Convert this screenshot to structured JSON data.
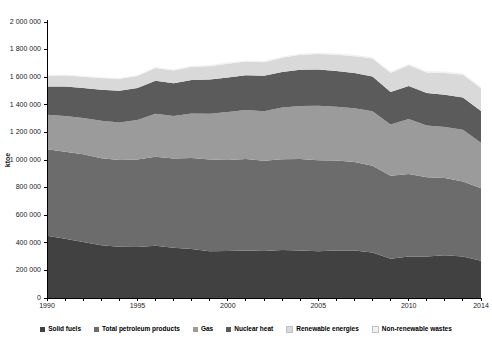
{
  "chart_data": {
    "type": "area",
    "stacked": true,
    "title": "",
    "subtitle": "",
    "xlabel": "",
    "ylabel": "ktoe",
    "ylim": [
      0,
      2000000
    ],
    "xlim": [
      1990,
      2014
    ],
    "grid": false,
    "legend_position": "bottom",
    "ytick_labels": [
      "0",
      "200 000",
      "400 000",
      "600 000",
      "800 000",
      "1 000 000",
      "1 200 000",
      "1 400 000",
      "1 600 000",
      "1 800 000",
      "2 000 000"
    ],
    "ytick_values": [
      0,
      200000,
      400000,
      600000,
      800000,
      1000000,
      1200000,
      1400000,
      1600000,
      1800000,
      2000000
    ],
    "xtick_labels": [
      "1990",
      "1995",
      "2000",
      "2005",
      "2010",
      "2014"
    ],
    "xtick_values": [
      1990,
      1995,
      2000,
      2005,
      2010,
      2014
    ],
    "x": [
      1990,
      1991,
      1992,
      1993,
      1994,
      1995,
      1996,
      1997,
      1998,
      1999,
      2000,
      2001,
      2002,
      2003,
      2004,
      2005,
      2006,
      2007,
      2008,
      2009,
      2010,
      2011,
      2012,
      2013,
      2014
    ],
    "series": [
      {
        "name": "Solid fuels",
        "color": "#414141",
        "values": [
          451000,
          430000,
          405000,
          382000,
          372000,
          370000,
          378000,
          365000,
          355000,
          338000,
          340000,
          345000,
          340000,
          348000,
          345000,
          339000,
          345000,
          345000,
          330000,
          285000,
          300000,
          300000,
          310000,
          300000,
          270000
        ]
      },
      {
        "name": "Total petroleum products",
        "color": "#6c6c6c",
        "values": [
          627000,
          630000,
          637000,
          630000,
          628000,
          634000,
          645000,
          645000,
          660000,
          665000,
          660000,
          662000,
          655000,
          657000,
          662000,
          660000,
          652000,
          640000,
          628000,
          600000,
          598000,
          575000,
          560000,
          545000,
          525000
        ]
      },
      {
        "name": "Gas",
        "color": "#9b9b9b",
        "values": [
          250000,
          258000,
          262000,
          272000,
          272000,
          285000,
          312000,
          308000,
          322000,
          333000,
          348000,
          355000,
          358000,
          375000,
          385000,
          395000,
          388000,
          390000,
          395000,
          372000,
          400000,
          375000,
          370000,
          375000,
          330000
        ]
      },
      {
        "name": "Nuclear heat",
        "color": "#5b5b5b",
        "values": [
          205000,
          215000,
          218000,
          225000,
          230000,
          232000,
          240000,
          238000,
          243000,
          248000,
          250000,
          253000,
          257000,
          258000,
          262000,
          262000,
          260000,
          255000,
          252000,
          236000,
          238000,
          236000,
          232000,
          232000,
          230000
        ]
      },
      {
        "name": "Renewable energies",
        "color": "#d9d9d9",
        "values": [
          78000,
          80000,
          82000,
          85000,
          86000,
          88000,
          92000,
          92000,
          95000,
          96000,
          100000,
          98000,
          98000,
          103000,
          108000,
          112000,
          118000,
          122000,
          130000,
          138000,
          150000,
          148000,
          158000,
          165000,
          165000
        ]
      },
      {
        "name": "Non-renewable wastes",
        "color": "#f1f1f1",
        "values": [
          6000,
          6000,
          6500,
          6500,
          7000,
          7000,
          7500,
          7500,
          8000,
          8000,
          8500,
          8500,
          9000,
          9000,
          9500,
          9500,
          10000,
          10000,
          10000,
          10000,
          10500,
          10500,
          10500,
          11000,
          11000
        ]
      }
    ]
  },
  "legend": {
    "items": [
      {
        "label": "Solid fuels",
        "color": "#414141"
      },
      {
        "label": "Total petroleum products",
        "color": "#6c6c6c"
      },
      {
        "label": "Gas",
        "color": "#9b9b9b"
      },
      {
        "label": "Nuclear heat",
        "color": "#5b5b5b"
      },
      {
        "label": "Renewable energies",
        "color": "#d9d9d9"
      },
      {
        "label": "Non-renewable wastes",
        "color": "#f1f1f1"
      }
    ]
  },
  "axes": {
    "y_axis_title": "ktoe"
  }
}
